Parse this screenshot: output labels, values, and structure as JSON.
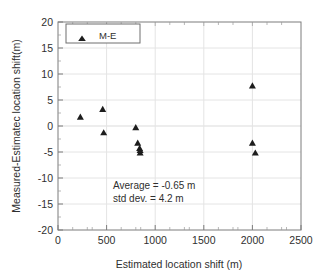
{
  "chart_data": {
    "type": "scatter",
    "title": "",
    "xlabel": "Estimated location shift (m)",
    "ylabel": "Measured-Estimatec location shift(m)",
    "xlim": [
      0,
      2500
    ],
    "ylim": [
      -20,
      20
    ],
    "xticks": [
      0,
      500,
      1000,
      1500,
      2000,
      2500
    ],
    "yticks": [
      20,
      15,
      10,
      5,
      0,
      -5,
      -10,
      -15,
      -20
    ],
    "xtick_labels": [
      "0",
      "500",
      "1000",
      "1500",
      "2000",
      "2500"
    ],
    "ytick_labels": [
      "20",
      "15",
      "10",
      "5",
      "0",
      "-5",
      "-10",
      "-15",
      "-20"
    ],
    "grid": true,
    "legend_position": "top-left",
    "series": [
      {
        "name": "M-E",
        "marker": "triangle-up",
        "color": "#1d1d1d",
        "points": [
          {
            "x": 230,
            "y": 1.8
          },
          {
            "x": 460,
            "y": 3.3
          },
          {
            "x": 470,
            "y": -1.2
          },
          {
            "x": 800,
            "y": -0.2
          },
          {
            "x": 820,
            "y": -3.2
          },
          {
            "x": 840,
            "y": -4.2
          },
          {
            "x": 845,
            "y": -4.6
          },
          {
            "x": 845,
            "y": -5.1
          },
          {
            "x": 2000,
            "y": 7.8
          },
          {
            "x": 2000,
            "y": -3.2
          },
          {
            "x": 2030,
            "y": -5.1
          }
        ]
      }
    ],
    "annotations": [
      {
        "text": "Average =  -0.65 m",
        "x": 900,
        "y": -12.0
      },
      {
        "text": "std dev.  =  4.2 m",
        "x": 900,
        "y": -14.6
      }
    ]
  },
  "legend": {
    "entries": [
      {
        "label": "M-E",
        "marker": "triangle-up"
      }
    ]
  },
  "axes": {
    "x_title": "Estimated location shift (m)",
    "y_title": "Measured-Estimatec location shift(m)",
    "x_tick_labels": [
      "0",
      "500",
      "1000",
      "1500",
      "2000",
      "2500"
    ],
    "y_tick_labels": [
      "20",
      "15",
      "10",
      "5",
      "0",
      "-5",
      "-10",
      "-15",
      "-20"
    ]
  },
  "statistics": {
    "average_label": "Average =  -0.65 m",
    "std_dev_label": "std dev.  =  4.2 m"
  },
  "colors": {
    "marker": "#1d1d1d",
    "frame": "#7d7d7d",
    "grid": "#e4e4e4",
    "text": "#2f2f2f",
    "background": "#ffffff"
  }
}
